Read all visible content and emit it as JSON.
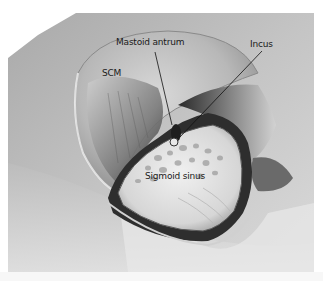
{
  "figure": {
    "labels": {
      "mastoid_antrum": "Mastoid antrum",
      "incus": "Incus",
      "scm": "SCM",
      "sigmoid_sinus": "Sigmoid sinus"
    },
    "colors": {
      "background": "#ffffff",
      "skin": "#b9b9b9",
      "bone": "#e6e6e6",
      "shadow": "#2a2a2a",
      "label_text": "#1a1a1a"
    }
  }
}
